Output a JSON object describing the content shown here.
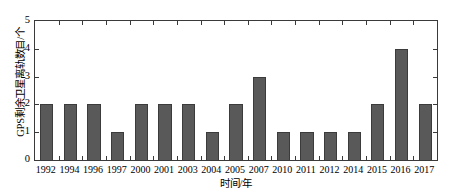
{
  "chart_data": {
    "type": "bar",
    "title": "",
    "subtitle": "",
    "xlabel": "时间/年",
    "ylabel": "GPS剩余卫星离轨数目/个",
    "categories": [
      "1992",
      "1994",
      "1996",
      "1997",
      "2000",
      "2001",
      "2003",
      "2004",
      "2005",
      "2007",
      "2010",
      "2011",
      "2012",
      "2014",
      "2015",
      "2016",
      "2017"
    ],
    "values": [
      2,
      2,
      2,
      1,
      2,
      2,
      2,
      1,
      2,
      3,
      1,
      1,
      1,
      1,
      2,
      4,
      2
    ],
    "ylim": [
      0,
      5
    ],
    "yticks": [
      0,
      1,
      2,
      3,
      4,
      5
    ],
    "ytick_labels": [
      "0",
      "1",
      "2",
      "3",
      "4",
      "5"
    ],
    "xlim_categories": 17,
    "grid": false,
    "legend": null,
    "legend_position": "none",
    "annotations": [],
    "bar_color": "#595959",
    "bar_edge_color": "#3b3b3b",
    "axis_color": "#3a3a3a",
    "background_color": "#ffffff",
    "tick_direction": "in"
  }
}
